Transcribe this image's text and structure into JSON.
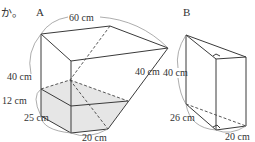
{
  "header": {
    "fragment": "か。"
  },
  "figures": [
    {
      "id": "A",
      "label": "A",
      "dimensions": {
        "top_length": "60 cm",
        "slant_edge": "40 cm",
        "height": "40 cm",
        "water_level": "12 cm",
        "depth": "25 cm",
        "width": "20 cm"
      }
    },
    {
      "id": "B",
      "label": "B",
      "dimensions": {
        "height": "40 cm",
        "depth": "26 cm",
        "width": "20 cm"
      }
    }
  ],
  "colors": {
    "line": "#3a3a3a",
    "shade": "#e6e6e6",
    "text": "#333333"
  }
}
